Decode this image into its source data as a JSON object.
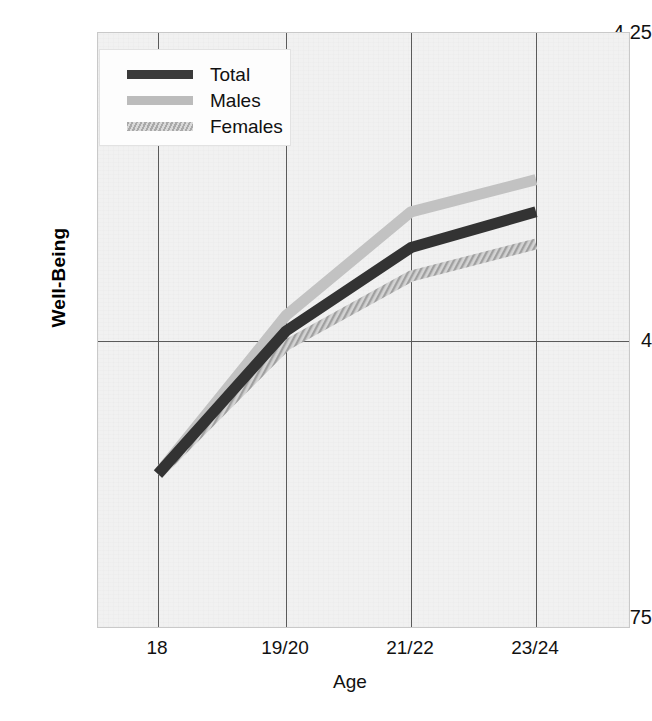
{
  "chart_data": {
    "type": "line",
    "title": "",
    "xlabel": "Age",
    "ylabel": "Well-Being",
    "categories": [
      "18",
      "19/20",
      "21/22",
      "23/24"
    ],
    "ylim": [
      3.75,
      4.25
    ],
    "yticks": [
      "3.75",
      "4",
      "4.25"
    ],
    "ytick_values": [
      3.75,
      4.0,
      4.25
    ],
    "grid": true,
    "legend_position": "top-left",
    "series": [
      {
        "name": "Total",
        "color": "#3a3a3a",
        "values": [
          3.88,
          4.0,
          4.07,
          4.1
        ]
      },
      {
        "name": "Males",
        "color": "#bcbcbc",
        "values": [
          3.88,
          4.013,
          4.1,
          4.127
        ]
      },
      {
        "name": "Females",
        "color": "#a9a9a9",
        "values": [
          3.88,
          3.988,
          4.046,
          4.073
        ]
      }
    ]
  },
  "axes": {
    "y_tick_top": "4.25",
    "y_tick_mid": "4",
    "y_tick_bottom": "3.75",
    "y_title": "Well-Being",
    "x_title": "Age",
    "x_ticks": [
      "18",
      "19/20",
      "21/22",
      "23/24"
    ]
  },
  "legend": {
    "items": [
      {
        "label": "Total"
      },
      {
        "label": "Males"
      },
      {
        "label": "Females"
      }
    ]
  }
}
